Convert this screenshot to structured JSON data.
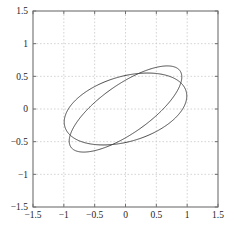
{
  "figure": {
    "caption": "",
    "background": "#ffffff"
  },
  "chart_data": {
    "type": "line",
    "title": "",
    "subtitle": "",
    "xlabel": "",
    "ylabel": "",
    "xlim": [
      -1.5,
      1.5
    ],
    "ylim": [
      -1.5,
      1.5
    ],
    "grid": true,
    "grid_style": "dashed",
    "grid_color": "#c9c9c9",
    "axis_color": "#6f6f6f",
    "curve_color": "#4a4a4a",
    "curve_width": 1.0,
    "legend": null,
    "legend_position": "none",
    "xticks": [
      -1.5,
      -1,
      -0.5,
      0,
      0.5,
      1,
      1.5
    ],
    "yticks": [
      -1.5,
      -1,
      -0.5,
      0,
      0.5,
      1,
      1.5
    ],
    "xtick_labels": [
      "−1.5",
      "−1",
      "−0.5",
      "0",
      "0.5",
      "1",
      "1.5"
    ],
    "ytick_labels": [
      "−1.5",
      "−1",
      "−0.5",
      "0",
      "0.5",
      "1",
      "1.5"
    ],
    "tick_direction": "in",
    "series": [
      {
        "name": "ellipse-flat",
        "shape": "ellipse",
        "center": [
          0.0,
          0.0
        ],
        "semi_major": 1.02,
        "semi_minor": 0.5,
        "rotation_deg": 15,
        "extrema": {
          "leftmost": [
            -1.0,
            -0.02
          ],
          "rightmost": [
            1.0,
            0.02
          ],
          "topmost": [
            -0.12,
            0.5
          ],
          "bottommost": [
            0.12,
            -0.5
          ]
        }
      },
      {
        "name": "ellipse-steep",
        "shape": "ellipse",
        "center": [
          0.0,
          0.0
        ],
        "semi_major": 1.06,
        "semi_minor": 0.38,
        "rotation_deg": 33,
        "extrema": {
          "leftmost": [
            -0.93,
            -0.4
          ],
          "rightmost": [
            0.93,
            0.4
          ],
          "topmost": [
            0.47,
            0.66
          ],
          "bottommost": [
            -0.47,
            -0.66
          ]
        }
      }
    ]
  }
}
